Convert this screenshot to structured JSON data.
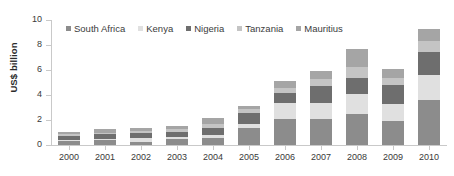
{
  "chart_data": {
    "type": "bar",
    "stacked": true,
    "title": "",
    "xlabel": "",
    "ylabel": "US$ billion",
    "ylim": [
      0,
      10
    ],
    "yticks": [
      0,
      2,
      4,
      6,
      8,
      10
    ],
    "grid": false,
    "legend_position": "top-inside",
    "categories": [
      "2000",
      "2001",
      "2002",
      "2003",
      "2004",
      "2005",
      "2006",
      "2007",
      "2008",
      "2009",
      "2010"
    ],
    "series": [
      {
        "name": "South Africa",
        "color": "#8c8c8c",
        "values": [
          0.3,
          0.4,
          0.25,
          0.45,
          0.55,
          1.4,
          2.05,
          2.1,
          2.45,
          1.9,
          3.6
        ]
      },
      {
        "name": "Kenya",
        "color": "#e0e0e0",
        "values": [
          0.12,
          0.12,
          0.3,
          0.2,
          0.25,
          0.25,
          1.3,
          1.3,
          1.65,
          1.4,
          2.0
        ]
      },
      {
        "name": "Nigeria",
        "color": "#6e6e6e",
        "values": [
          0.3,
          0.35,
          0.4,
          0.4,
          0.55,
          0.95,
          0.85,
          1.3,
          1.3,
          1.5,
          1.85
        ]
      },
      {
        "name": "Tanzania",
        "color": "#c4c4c4",
        "values": [
          0.13,
          0.13,
          0.2,
          0.2,
          0.35,
          0.25,
          0.4,
          0.55,
          0.85,
          0.6,
          0.9
        ]
      },
      {
        "name": "Mauritius",
        "color": "#a5a5a5",
        "values": [
          0.2,
          0.25,
          0.25,
          0.3,
          0.45,
          0.3,
          0.5,
          0.65,
          1.45,
          0.7,
          0.95
        ]
      }
    ],
    "totals": [
      1.05,
      1.25,
      1.4,
      1.55,
      2.15,
      3.15,
      5.1,
      5.9,
      7.7,
      6.1,
      9.3
    ]
  },
  "axis": {
    "ytick_labels": [
      "0",
      "2",
      "4",
      "6",
      "8",
      "10"
    ],
    "ylabel_text": "US$ billion"
  }
}
